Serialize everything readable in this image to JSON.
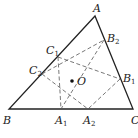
{
  "diagram": {
    "type": "geometry",
    "points": {
      "A": {
        "label": "A",
        "x": 95,
        "y": 16
      },
      "B": {
        "label": "B",
        "x": 9,
        "y": 109
      },
      "C": {
        "label": "C",
        "x": 133,
        "y": 109
      },
      "A1": {
        "label": "A",
        "sub": "1",
        "x": 61,
        "y": 109
      },
      "A2": {
        "label": "A",
        "sub": "2",
        "x": 88,
        "y": 109
      },
      "B1": {
        "label": "B",
        "sub": "1",
        "x": 120,
        "y": 79
      },
      "B2": {
        "label": "B",
        "sub": "2",
        "x": 104,
        "y": 40
      },
      "C1": {
        "label": "C",
        "sub": "1",
        "x": 58,
        "y": 57
      },
      "C2": {
        "label": "C",
        "sub": "2",
        "x": 42,
        "y": 74
      },
      "O": {
        "label": "O",
        "x": 72,
        "y": 81
      }
    },
    "triangle": [
      "A",
      "B",
      "C"
    ],
    "dashed_segments": [
      [
        "C1",
        "A1"
      ],
      [
        "C1",
        "B1"
      ],
      [
        "C2",
        "B2"
      ],
      [
        "C2",
        "A2"
      ],
      [
        "B2",
        "A1"
      ],
      [
        "B1",
        "A2"
      ]
    ],
    "colors": {
      "line": "#222222",
      "dash": "#555555"
    }
  }
}
